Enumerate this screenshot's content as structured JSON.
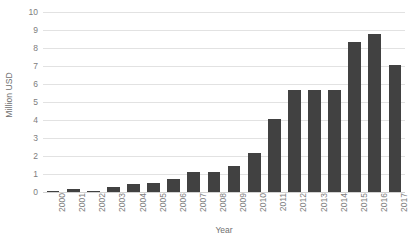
{
  "chart_data": {
    "type": "bar",
    "title": "",
    "xlabel": "Year",
    "ylabel": "Million USD",
    "categories": [
      "2000",
      "2001",
      "2002",
      "2003",
      "2004",
      "2005",
      "2006",
      "2007",
      "2008",
      "2009",
      "2010",
      "2011",
      "2012",
      "2013",
      "2014",
      "2015",
      "2016",
      "2017"
    ],
    "values": [
      0.08,
      0.17,
      0.08,
      0.28,
      0.42,
      0.52,
      0.72,
      1.12,
      1.12,
      1.45,
      2.17,
      4.07,
      5.64,
      5.64,
      5.69,
      8.35,
      8.78,
      7.03
    ],
    "series": [
      {
        "name": "Million USD",
        "values": [
          0.08,
          0.17,
          0.08,
          0.28,
          0.42,
          0.52,
          0.72,
          1.12,
          1.12,
          1.45,
          2.17,
          4.07,
          5.64,
          5.64,
          5.69,
          8.35,
          8.78,
          7.03
        ]
      }
    ],
    "ylim": [
      0,
      10
    ],
    "y_ticks": [
      0,
      1,
      2,
      3,
      4,
      5,
      6,
      7,
      8,
      9,
      10
    ],
    "y_tick_labels": [
      "0",
      "1",
      "2",
      "3",
      "4",
      "5",
      "6",
      "7",
      "8",
      "9",
      "10"
    ],
    "grid": true,
    "grid_axis": "y",
    "legend": false,
    "legend_position": "none",
    "bar_color": "#414141",
    "gridline_color": "#e2e2e2",
    "background_color": "#ffffff",
    "text_color": "#7d7d7d"
  }
}
